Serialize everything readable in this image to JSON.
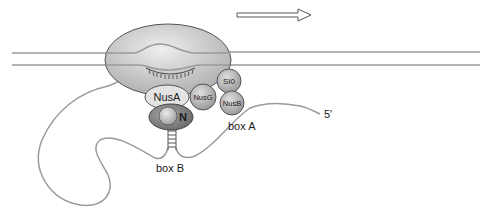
{
  "diagram": {
    "title": "",
    "direction_arrow": "transcription-direction",
    "components": {
      "rnap": "",
      "nusA": "NusA",
      "nusG": "NusG",
      "s10": "SI0",
      "nusB": "NusB",
      "n_protein": "N"
    },
    "labels": {
      "box_a": "box A",
      "box_b": "box B",
      "five_prime": "5′"
    },
    "colors": {
      "rnap_fill": "#c8c8c8",
      "rnap_stroke": "#555555",
      "nus_fill": "#b8b8b8",
      "nusA_fill": "#e3e3e3",
      "n_outer": "#8a8a8a",
      "dna": "#9a9a9a",
      "rna": "#9a9a9a"
    }
  }
}
